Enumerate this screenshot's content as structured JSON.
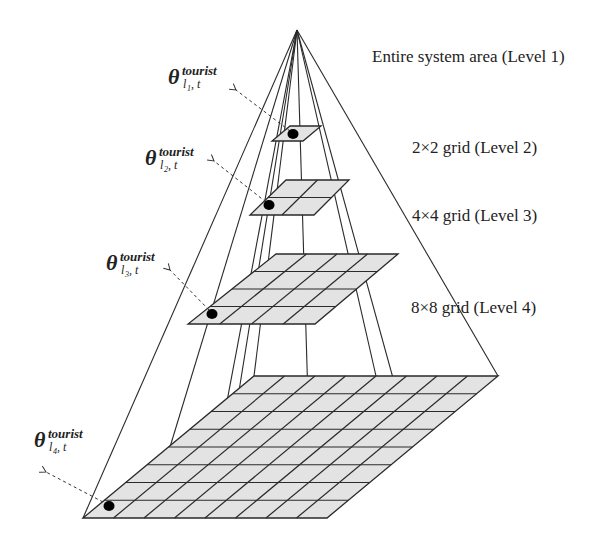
{
  "diagram": {
    "apex": [
      297,
      30
    ],
    "levels": [
      {
        "id": "level-1",
        "label": "Entire system area (Level 1)",
        "label_pos": [
          372,
          62
        ]
      },
      {
        "id": "level-2",
        "label": "2×2 grid (Level 2)",
        "label_pos": [
          412,
          153
        ],
        "plane": {
          "bl": [
            272,
            141
          ],
          "br": [
            303,
            141
          ],
          "tr": [
            321,
            126
          ],
          "tl": [
            290,
            126
          ]
        },
        "divisions": 1,
        "dot": [
          293,
          134
        ],
        "theta": {
          "symbol": "θ",
          "sup": "tourist",
          "sub_l": "l",
          "sub_idx": "1",
          "sub_t": ", t",
          "pos": [
            168,
            84
          ]
        },
        "arrow": {
          "from": [
            290,
            131
          ],
          "to": [
            236,
            90
          ]
        }
      },
      {
        "id": "level-3",
        "label": "4×4 grid (Level 3)",
        "label_pos": [
          412,
          221
        ],
        "plane": {
          "bl": [
            250,
            215
          ],
          "br": [
            314,
            215
          ],
          "tr": [
            349,
            180
          ],
          "tl": [
            286,
            180
          ]
        },
        "divisions": 2,
        "dot": [
          269,
          205
        ],
        "theta": {
          "symbol": "θ",
          "sup": "tourist",
          "sub_l": "l",
          "sub_idx": "2",
          "sub_t": ", t",
          "pos": [
            145,
            165
          ]
        },
        "arrow": {
          "from": [
            266,
            202
          ],
          "to": [
            214,
            161
          ]
        }
      },
      {
        "id": "level-4",
        "label": "8×8 grid (Level 4)",
        "label_pos": [
          411,
          313
        ],
        "plane": {
          "bl": [
            188,
            324
          ],
          "br": [
            315,
            324
          ],
          "tr": [
            398,
            254
          ],
          "tl": [
            276,
            254
          ]
        },
        "divisions": 4,
        "dot": [
          212,
          314
        ],
        "theta": {
          "symbol": "θ",
          "sup": "tourist",
          "sub_l": "l",
          "sub_idx": "3",
          "sub_t": ", t",
          "pos": [
            106,
            270
          ]
        },
        "arrow": {
          "from": [
            209,
            310
          ],
          "to": [
            170,
            270
          ]
        }
      },
      {
        "id": "base",
        "label": "",
        "plane": {
          "bl": [
            83,
            518
          ],
          "br": [
            327,
            518
          ],
          "tr": [
            498,
            376
          ],
          "tl": [
            254,
            376
          ]
        },
        "divisions": 8,
        "dot": [
          109,
          506
        ],
        "theta": {
          "symbol": "θ",
          "sup": "tourist",
          "sub_l": "l",
          "sub_idx": "4",
          "sub_t": ", t",
          "pos": [
            34,
            447
          ]
        },
        "arrow": {
          "from": [
            103,
            502
          ],
          "to": [
            46,
            472
          ]
        }
      }
    ],
    "pyramid_edges": [
      [
        [
          297,
          30
        ],
        [
          83,
          518
        ]
      ],
      [
        [
          297,
          30
        ],
        [
          498,
          376
        ]
      ],
      [
        [
          297,
          30
        ],
        [
          170,
          447
        ]
      ],
      [
        [
          297,
          30
        ],
        [
          205,
          518
        ]
      ],
      [
        [
          297,
          30
        ],
        [
          254,
          376
        ]
      ],
      [
        [
          297,
          30
        ],
        [
          230,
          447
        ]
      ],
      [
        [
          297,
          30
        ],
        [
          309,
          433
        ]
      ],
      [
        [
          297,
          30
        ],
        [
          376,
          376
        ]
      ],
      [
        [
          297,
          30
        ],
        [
          412,
          447
        ]
      ]
    ],
    "colors": {
      "plane_fill": "#e3e3e3",
      "line": "#2a2a2a",
      "dot": "#000000",
      "text": "#222222",
      "background": "#ffffff"
    }
  }
}
